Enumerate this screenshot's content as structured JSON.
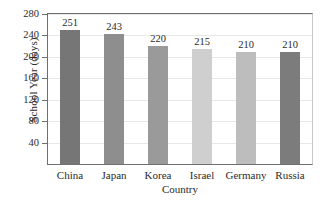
{
  "chart_data": {
    "type": "bar",
    "title": "",
    "categories": [
      "China",
      "Japan",
      "Korea",
      "Israel",
      "Germany",
      "Russia"
    ],
    "values": [
      251,
      243,
      220,
      215,
      210,
      210
    ],
    "value_labels": [
      "251",
      "243",
      "220",
      "215",
      "210",
      "210"
    ],
    "bar_colors": [
      "#767676",
      "#8e8e8e",
      "#9a9a9a",
      "#cfcfcf",
      "#bdbdbd",
      "#7c7c7c"
    ],
    "xlabel": "Country",
    "ylabel": "School Year (days)",
    "ylim": [
      0,
      280
    ],
    "yticks": [
      40,
      80,
      120,
      160,
      200,
      240,
      280
    ],
    "ytick_labels": [
      "40",
      "80",
      "120",
      "160",
      "200",
      "240",
      "280"
    ],
    "grid": true,
    "legend": "none",
    "axis_color": "#6f6f6f",
    "grid_color": "#e8e8e8",
    "background": "#ffffff"
  }
}
